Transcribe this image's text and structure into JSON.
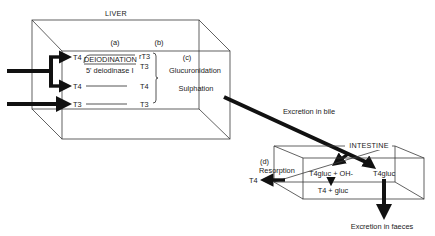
{
  "diagram": {
    "liver": {
      "title": "LIVER",
      "column_labels": {
        "a": "(a)",
        "b": "(b)",
        "c": "(c)"
      },
      "rows": [
        {
          "input": "T4",
          "process": "DEIODINATION",
          "subprocess": "5' deiodinase I",
          "outputs": [
            "rT3",
            "T3"
          ]
        },
        {
          "input": "T4",
          "output": "T4"
        },
        {
          "input": "T3",
          "output": "T3"
        }
      ],
      "conjugation": [
        "Glucuronidation",
        "Sulphation"
      ]
    },
    "bile_label": "Excretion in bile",
    "intestine": {
      "title": "INTESTINE",
      "label_d": "(d)",
      "resorption_label": "Resorption",
      "resorbed_hormone": "T4",
      "hydrolysis_reactants": "T4gluc + OH-",
      "hydrolysis_products": "T4 + gluc",
      "unchanged": "T4gluc"
    },
    "faeces_label": "Excretion in faeces"
  }
}
